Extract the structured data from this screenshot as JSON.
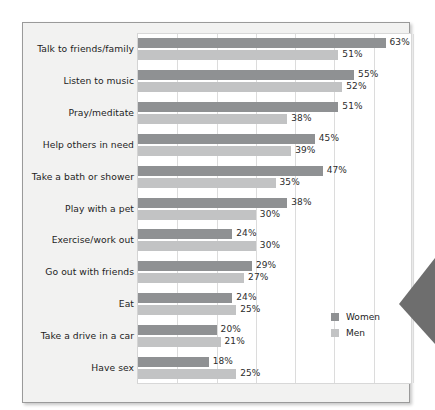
{
  "chart_data": {
    "type": "bar",
    "orientation": "horizontal",
    "title": "",
    "subtitle": "",
    "xlabel": "",
    "ylabel": "",
    "xlim": [
      0,
      70
    ],
    "xtick_labels": [
      "",
      "",
      "",
      "",
      "",
      "",
      "",
      ""
    ],
    "xtick_values": [
      0,
      10,
      20,
      30,
      40,
      50,
      60,
      70
    ],
    "grid": "vertical",
    "value_suffix": "%",
    "legend_position": "inside-bottom-right",
    "categories": [
      "Talk to friends/family",
      "Listen to music",
      "Pray/meditate",
      "Help others in need",
      "Take a bath or shower",
      "Play with a pet",
      "Exercise/work out",
      "Go out with friends",
      "Eat",
      "Take a drive in a car",
      "Have sex"
    ],
    "series": [
      {
        "name": "Women",
        "color": "#8f9193",
        "values": [
          63,
          55,
          51,
          45,
          47,
          38,
          24,
          29,
          24,
          20,
          18
        ],
        "labels": [
          "63%",
          "55%",
          "51%",
          "45%",
          "47%",
          "38%",
          "24%",
          "29%",
          "24%",
          "20%",
          "18%"
        ]
      },
      {
        "name": "Men",
        "color": "#c2c3c4",
        "values": [
          51,
          52,
          38,
          39,
          35,
          30,
          30,
          27,
          25,
          21,
          25
        ],
        "labels": [
          "51%",
          "52%",
          "38%",
          "39%",
          "35%",
          "30%",
          "30%",
          "27%",
          "25%",
          "21%",
          "25%"
        ]
      }
    ]
  },
  "legend": {
    "items": [
      {
        "label": "Women",
        "color": "#8f9193"
      },
      {
        "label": "Men",
        "color": "#c2c3c4"
      }
    ]
  },
  "decoration": {
    "callout_arrow": "left-pointing-triangle",
    "callout_arrow_color": "#6e6e6e"
  },
  "colors": {
    "women_bar": "#8f9193",
    "men_bar": "#c2c3c4",
    "panel_background": "#f2f2f1",
    "plot_background": "#ffffff",
    "gridline": "#dcdcdc",
    "panel_border": "#9a9a9a",
    "text": "#1d1d1d"
  }
}
